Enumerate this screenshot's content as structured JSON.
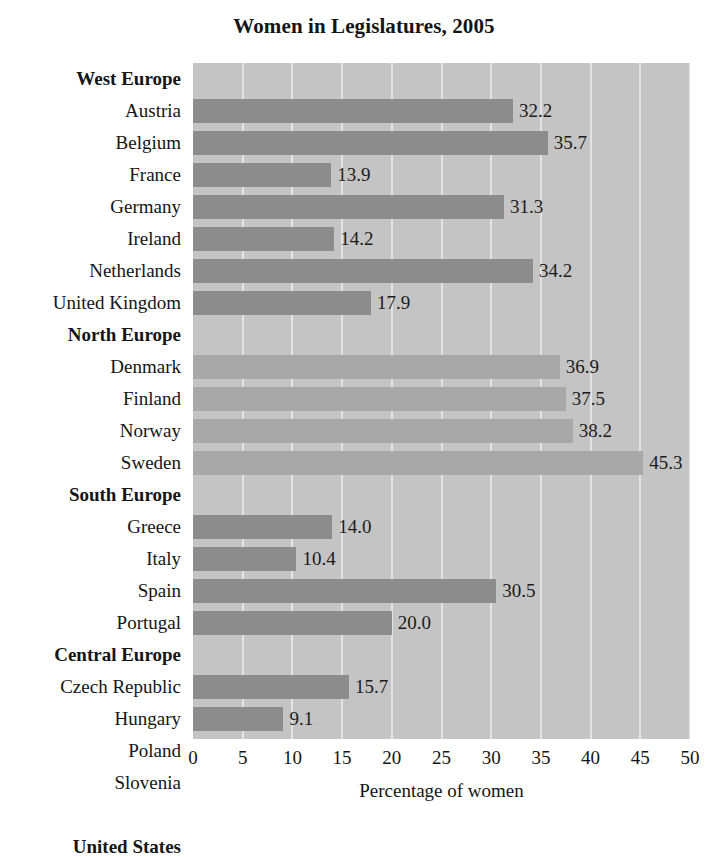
{
  "chart_data": {
    "type": "bar",
    "orientation": "horizontal",
    "title": "Women in Legislatures, 2005",
    "xlabel": "Percentage of women",
    "ylabel": "",
    "xlim": [
      0,
      50
    ],
    "xticks": [
      0,
      5,
      10,
      15,
      20,
      25,
      30,
      35,
      40,
      45,
      50
    ],
    "xtick_labels": [
      "0",
      "5",
      "10",
      "15",
      "20",
      "25",
      "30",
      "35",
      "40",
      "45",
      "50"
    ],
    "grid": "vertical",
    "legend": "none",
    "plot_background": "#c4c4c4",
    "gridline_color": "#e3e3e3",
    "bar_color_dark": "#8c8c8c",
    "bar_color_light": "#a8a8a8",
    "rows": [
      {
        "label": "West Europe",
        "kind": "group",
        "value": null,
        "value_label": "",
        "color": ""
      },
      {
        "label": "Austria",
        "kind": "bar",
        "value": 32.2,
        "value_label": "32.2",
        "color": "dark"
      },
      {
        "label": "Belgium",
        "kind": "bar",
        "value": 35.7,
        "value_label": "35.7",
        "color": "dark"
      },
      {
        "label": "France",
        "kind": "bar",
        "value": 13.9,
        "value_label": "13.9",
        "color": "dark"
      },
      {
        "label": "Germany",
        "kind": "bar",
        "value": 31.3,
        "value_label": "31.3",
        "color": "dark"
      },
      {
        "label": "Ireland",
        "kind": "bar",
        "value": 14.2,
        "value_label": "14.2",
        "color": "dark"
      },
      {
        "label": "Netherlands",
        "kind": "bar",
        "value": 34.2,
        "value_label": "34.2",
        "color": "dark"
      },
      {
        "label": "United Kingdom",
        "kind": "bar",
        "value": 17.9,
        "value_label": "17.9",
        "color": "dark"
      },
      {
        "label": "North Europe",
        "kind": "group",
        "value": null,
        "value_label": "",
        "color": ""
      },
      {
        "label": "Denmark",
        "kind": "bar",
        "value": 36.9,
        "value_label": "36.9",
        "color": "light"
      },
      {
        "label": "Finland",
        "kind": "bar",
        "value": 37.5,
        "value_label": "37.5",
        "color": "light"
      },
      {
        "label": "Norway",
        "kind": "bar",
        "value": 38.2,
        "value_label": "38.2",
        "color": "light"
      },
      {
        "label": "Sweden",
        "kind": "bar",
        "value": 45.3,
        "value_label": "45.3",
        "color": "light"
      },
      {
        "label": "South Europe",
        "kind": "group",
        "value": null,
        "value_label": "",
        "color": ""
      },
      {
        "label": "Greece",
        "kind": "bar",
        "value": 14.0,
        "value_label": "14.0",
        "color": "dark"
      },
      {
        "label": "Italy",
        "kind": "bar",
        "value": 10.4,
        "value_label": "10.4",
        "color": "dark"
      },
      {
        "label": "Spain",
        "kind": "bar",
        "value": 30.5,
        "value_label": "30.5",
        "color": "dark"
      },
      {
        "label": "Portugal",
        "kind": "bar",
        "value": 20.0,
        "value_label": "20.0",
        "color": "dark"
      },
      {
        "label": "Central Europe",
        "kind": "group",
        "value": null,
        "value_label": "",
        "color": ""
      },
      {
        "label": "Czech Republic",
        "kind": "bar",
        "value": 15.7,
        "value_label": "15.7",
        "color": "dark"
      },
      {
        "label": "Hungary",
        "kind": "bar",
        "value": 9.1,
        "value_label": "9.1",
        "color": "dark"
      },
      {
        "label": "Poland",
        "kind": "bar",
        "value": 20.7,
        "value_label": "20.7",
        "color": "dark"
      },
      {
        "label": "Slovenia",
        "kind": "bar",
        "value": 12.2,
        "value_label": "12.2",
        "color": "dark"
      },
      {
        "label": "",
        "kind": "spacer",
        "value": null,
        "value_label": "",
        "color": ""
      },
      {
        "label": "United States",
        "kind": "bar",
        "value": 14.8,
        "value_label": "14.8",
        "color": "dark",
        "bold": true
      }
    ]
  }
}
